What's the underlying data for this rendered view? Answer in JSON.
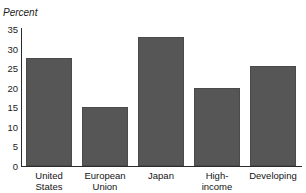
{
  "figure": {
    "title": "countries, 1995",
    "background_color": "#ffffff"
  },
  "axes": {
    "y_unit_label": "Percent",
    "y_ticks": [
      "35",
      "30",
      "25",
      "20",
      "15",
      "10",
      "5",
      "0"
    ]
  },
  "colors": {
    "bar_fill": "#565656",
    "axis": "#2b2b2b",
    "text": "#141414"
  },
  "chart_data": {
    "type": "bar",
    "title": "countries, 1995",
    "xlabel": "",
    "ylabel": "Percent",
    "ylim": [
      0,
      35
    ],
    "grid": false,
    "legend": null,
    "categories": [
      "United\nStates",
      "European\nUnion",
      "Japan",
      "High-\nincome",
      "Developing"
    ],
    "values": [
      27.7,
      15.0,
      33.0,
      20.0,
      25.5
    ],
    "tick_labels_y": [
      0,
      5,
      10,
      15,
      20,
      25,
      30,
      35
    ]
  }
}
